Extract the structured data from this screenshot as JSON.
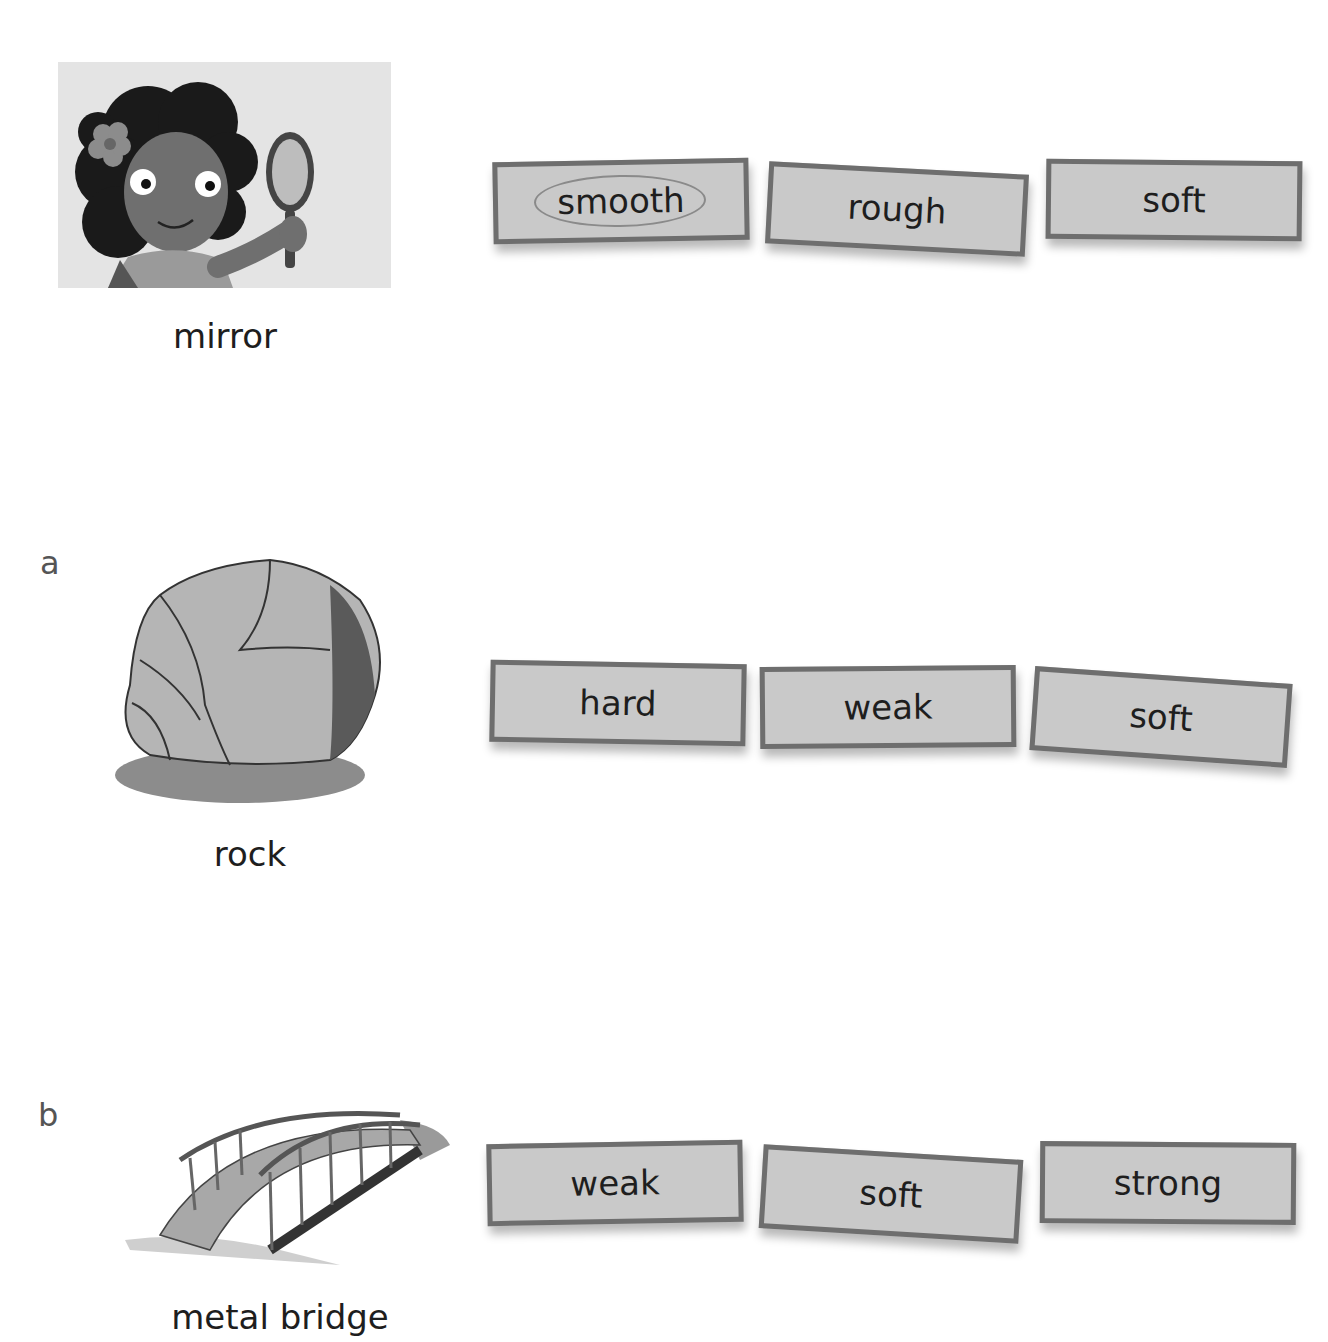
{
  "worksheet": {
    "example": {
      "label": "",
      "object_name": "mirror",
      "image": "girl-holding-mirror-illustration",
      "options": [
        {
          "word": "smooth",
          "circled": true
        },
        {
          "word": "rough",
          "circled": false
        },
        {
          "word": "soft",
          "circled": false
        }
      ]
    },
    "questions": [
      {
        "label": "a",
        "object_name": "rock",
        "image": "rock-illustration",
        "options": [
          {
            "word": "hard",
            "circled": false
          },
          {
            "word": "weak",
            "circled": false
          },
          {
            "word": "soft",
            "circled": false
          }
        ]
      },
      {
        "label": "b",
        "object_name": "metal bridge",
        "image": "metal-bridge-illustration",
        "options": [
          {
            "word": "weak",
            "circled": false
          },
          {
            "word": "soft",
            "circled": false
          },
          {
            "word": "strong",
            "circled": false
          }
        ]
      }
    ]
  },
  "colors": {
    "card_fill": "#c9c9c9",
    "card_border": "#6e6e6e",
    "text": "#1e1e1e"
  }
}
